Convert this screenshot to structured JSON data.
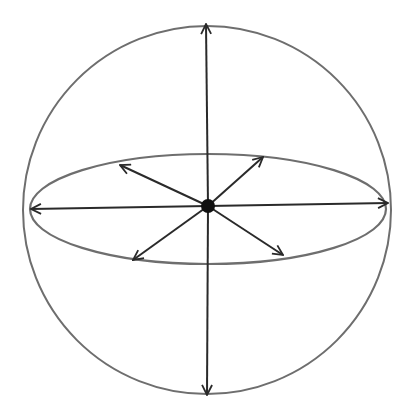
{
  "diagram": {
    "type": "sphere-with-radial-vectors",
    "colors": {
      "background": "#ffffff",
      "outline": "#6e6e6e",
      "arrow": "#2a2a2a",
      "center_dot": "#111111"
    },
    "sphere": {
      "cx": 207,
      "cy": 210,
      "r": 184
    },
    "equator_ellipse": {
      "cx": 208,
      "cy": 209,
      "rx": 178,
      "ry": 55
    },
    "center_point": {
      "x": 208,
      "y": 206,
      "r": 7
    },
    "vectors": [
      {
        "name": "up",
        "x2": 206,
        "y2": 24
      },
      {
        "name": "down",
        "x2": 207,
        "y2": 395
      },
      {
        "name": "left",
        "x2": 31,
        "y2": 209
      },
      {
        "name": "right",
        "x2": 388,
        "y2": 203
      },
      {
        "name": "upper-left",
        "x2": 120,
        "y2": 165
      },
      {
        "name": "upper-right",
        "x2": 263,
        "y2": 157
      },
      {
        "name": "lower-left",
        "x2": 133,
        "y2": 260
      },
      {
        "name": "lower-right",
        "x2": 283,
        "y2": 255
      }
    ]
  }
}
